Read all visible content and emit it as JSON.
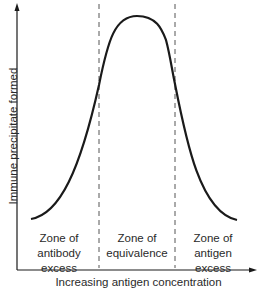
{
  "diagram": {
    "y_axis_label": "Immune precipitate formed",
    "x_axis_label": "Increasing antigen concentration",
    "zones": [
      {
        "line1": "Zone of",
        "line2": "antibody",
        "line3": "excess"
      },
      {
        "line1": "Zone of",
        "line2": "equivalence",
        "line3": ""
      },
      {
        "line1": "Zone of",
        "line2": "antigen",
        "line3": "excess"
      }
    ],
    "curve_description": "bell-shaped precipitin curve",
    "colors": {
      "line": "#1a1a1a",
      "dashed": "#555555",
      "text": "#2a2a2a"
    }
  }
}
